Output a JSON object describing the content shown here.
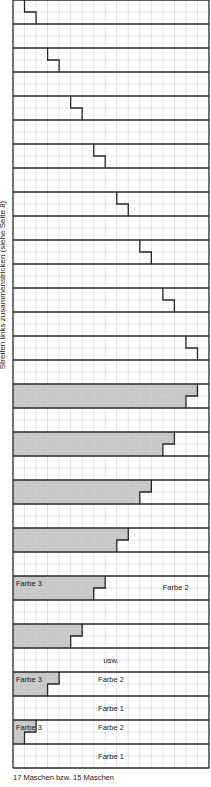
{
  "chart": {
    "columns": 17,
    "bands": 32,
    "rows_per_band": 2,
    "colors": {
      "gray_fill": "#c8c8c8",
      "thin_grid": "#cfcfcf",
      "thin_grid_on_gray": "#aaaaaa",
      "thick_line": "#262626"
    },
    "step_bands": [
      {
        "band": 0,
        "top_col": 1,
        "bottom_col": 2
      },
      {
        "band": 2,
        "top_col": 3,
        "bottom_col": 4
      },
      {
        "band": 4,
        "top_col": 5,
        "bottom_col": 6
      },
      {
        "band": 6,
        "top_col": 7,
        "bottom_col": 8
      },
      {
        "band": 8,
        "top_col": 9,
        "bottom_col": 10
      },
      {
        "band": 10,
        "top_col": 11,
        "bottom_col": 12
      },
      {
        "band": 12,
        "top_col": 13,
        "bottom_col": 14
      },
      {
        "band": 14,
        "top_col": 15,
        "bottom_col": 16
      }
    ],
    "gray_bands": [
      {
        "band": 16,
        "top_col": 16,
        "bottom_col": 15
      },
      {
        "band": 18,
        "top_col": 14,
        "bottom_col": 13
      },
      {
        "band": 20,
        "top_col": 12,
        "bottom_col": 11
      },
      {
        "band": 22,
        "top_col": 10,
        "bottom_col": 9
      },
      {
        "band": 24,
        "top_col": 8,
        "bottom_col": 7,
        "left_label": "Farbe 3",
        "right_label": "Farbe 2"
      },
      {
        "band": 26,
        "top_col": 6,
        "bottom_col": 5
      },
      {
        "band": 28,
        "top_col": 4,
        "bottom_col": 3,
        "left_label": "Farbe 3",
        "right_label": "Farbe 2"
      },
      {
        "band": 30,
        "top_col": 2,
        "bottom_col": 1,
        "left_label": "Farbe 3",
        "right_label": "Farbe 2"
      }
    ],
    "text_bands": [
      {
        "band": 27,
        "label": "usw."
      },
      {
        "band": 29,
        "label": "Farbe 1"
      },
      {
        "band": 31,
        "label": "Farbe 1"
      }
    ]
  },
  "side_label": "Streifen links zusammenstricken (siehe Seite 8)",
  "footer": "17 Maschen bzw. 15 Maschen"
}
